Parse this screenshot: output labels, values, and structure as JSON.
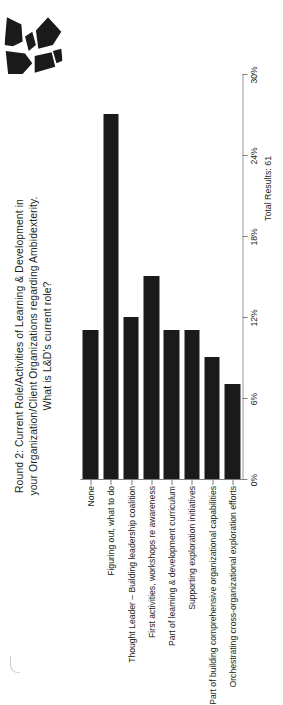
{
  "page": {
    "background": "#ffffff",
    "bar_color": "#1a1a1a",
    "axis_color": "#808080",
    "text_color": "#231f20"
  },
  "logo": {
    "name": "abstract-angular-mark",
    "color": "#1a1a1a"
  },
  "footer": {
    "total_results": "Total Results: 61"
  },
  "chart_data": {
    "type": "bar",
    "orientation": "horizontal",
    "title": "Round 2: Current Role/Activities of Learning & Development in your Organization/Client Organizations regarding Ambidexterity. What is L&D's current role?",
    "title_line1": "Round 2: Current Role/Activities of Learning & Development in",
    "title_line2": "your Organization/Client Organizations regarding Ambidexterity.",
    "title_line3": "What is L&D's current role?",
    "xlabel": "",
    "ylabel": "",
    "xlim": [
      0,
      30
    ],
    "grid": false,
    "legend": null,
    "tick_labels": [
      "0%",
      "6%",
      "12%",
      "18%",
      "24%",
      "30%"
    ],
    "tick_values": [
      0,
      6,
      12,
      18,
      24,
      30
    ],
    "categories": [
      "None",
      "Figuring out, what to do",
      "Thought Leader – Building leadership coalition",
      "First activities, workshops re awareness",
      "Part of learning & development curriculum",
      "Supporting exploration initiatives",
      "Part of building comprehensive organizational capabilities",
      "Orchestrating cross-organizational exploration efforts"
    ],
    "values": [
      11,
      27,
      12,
      15,
      11,
      11,
      9,
      7
    ],
    "value_labels": [
      "11%",
      "27%",
      "12%",
      "15%",
      "11%",
      "11%",
      "9%",
      "7%"
    ],
    "total_results": 61
  }
}
